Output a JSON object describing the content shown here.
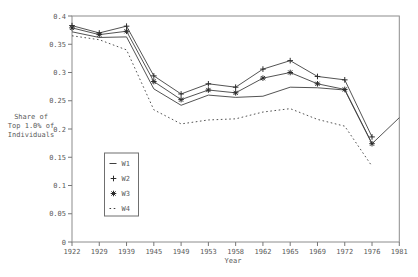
{
  "chart_data": {
    "type": "line",
    "title": "",
    "xlabel": "Year",
    "ylabel_lines": [
      "Share of",
      "Top 1.0% of",
      "Individuals"
    ],
    "categories": [
      "1922",
      "1929",
      "1939",
      "1945",
      "1949",
      "1953",
      "1958",
      "1962",
      "1965",
      "1969",
      "1972",
      "1976",
      "1981"
    ],
    "ylim": [
      0,
      0.4
    ],
    "y_tick_values": [
      0,
      0.05,
      0.1,
      0.15,
      0.2,
      0.25,
      0.3,
      0.35,
      0.4
    ],
    "y_tick_labels": [
      "0",
      "0.05",
      "0.1",
      "0.15",
      "0.2",
      "0.25",
      "0.3",
      "0.35",
      "0.4"
    ],
    "grid": false,
    "legend_position": "inside lower-left",
    "series": [
      {
        "name": "W1",
        "line": "solid",
        "marker": "none",
        "values": [
          0.372,
          0.362,
          0.363,
          0.271,
          0.242,
          0.26,
          0.256,
          0.258,
          0.274,
          0.273,
          0.269,
          0.174,
          0.22
        ]
      },
      {
        "name": "W2",
        "line": "solid",
        "marker": "plus",
        "values": [
          0.383,
          0.37,
          0.382,
          0.294,
          0.262,
          0.28,
          0.274,
          0.306,
          0.321,
          0.293,
          0.287,
          0.186,
          null
        ]
      },
      {
        "name": "W3",
        "line": "solid",
        "marker": "asterisk",
        "values": [
          0.379,
          0.367,
          0.373,
          0.284,
          0.252,
          0.269,
          0.264,
          0.29,
          0.3,
          0.28,
          0.27,
          0.174,
          null
        ]
      },
      {
        "name": "W4",
        "line": "dashed",
        "marker": "none",
        "values": [
          0.365,
          0.358,
          0.34,
          0.234,
          0.209,
          0.216,
          0.218,
          0.23,
          0.236,
          0.217,
          0.205,
          0.134,
          null
        ]
      }
    ],
    "legend_entries": [
      {
        "label": "W1",
        "symbol": "line"
      },
      {
        "label": "W2",
        "symbol": "plus"
      },
      {
        "label": "W3",
        "symbol": "asterisk"
      },
      {
        "label": "W4",
        "symbol": "dashes"
      }
    ]
  },
  "colors": {
    "background": "#ffffff",
    "frame": "#8c8c8c",
    "tick": "#777777",
    "text": "#5a5a5a",
    "series_line": "#3f3f3f",
    "marker": "#2b2b2b",
    "legend_border": "#6f6f6f"
  }
}
